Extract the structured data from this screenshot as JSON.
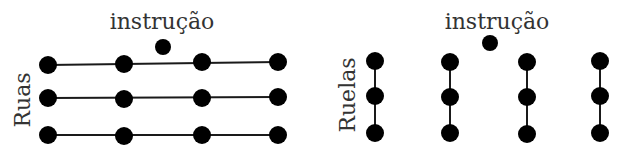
{
  "left_panel": {
    "title": "instrução",
    "side_label": "Ruas",
    "orientation": "horizontal",
    "rows": 3,
    "columns": 4
  },
  "right_panel": {
    "title": "instrução",
    "side_label": "Ruelas",
    "orientation": "vertical",
    "rows": 3,
    "columns": 4
  },
  "colors": {
    "dot": "#000000",
    "line": "#1a1a1a",
    "text": "#333333",
    "background": "#ffffff"
  }
}
